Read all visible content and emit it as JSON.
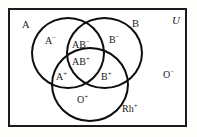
{
  "diagram": {
    "type": "venn",
    "universe_label": "U",
    "sets": [
      {
        "id": "A",
        "label": "A",
        "name": "circle-a"
      },
      {
        "id": "B",
        "label": "B",
        "name": "circle-b"
      },
      {
        "id": "Rh",
        "label": "Rh",
        "sign": "+",
        "name": "circle-rh"
      }
    ],
    "set_labels": {
      "a": "A",
      "b": "B",
      "rh_base": "Rh",
      "rh_sign": "+"
    },
    "regions": [
      {
        "id": "a-neg",
        "base": "A",
        "sign": "−",
        "in": [
          "A"
        ],
        "description": "A only"
      },
      {
        "id": "b-neg",
        "base": "B",
        "sign": "−",
        "in": [
          "B"
        ],
        "description": "B only"
      },
      {
        "id": "ab-neg",
        "base": "AB",
        "sign": "−",
        "in": [
          "A",
          "B"
        ],
        "description": "A and B, not Rh"
      },
      {
        "id": "ab-pos",
        "base": "AB",
        "sign": "+",
        "in": [
          "A",
          "B",
          "Rh"
        ],
        "description": "A and B and Rh"
      },
      {
        "id": "a-pos",
        "base": "A",
        "sign": "+",
        "in": [
          "A",
          "Rh"
        ],
        "description": "A and Rh"
      },
      {
        "id": "b-pos",
        "base": "B",
        "sign": "+",
        "in": [
          "B",
          "Rh"
        ],
        "description": "B and Rh"
      },
      {
        "id": "o-pos",
        "base": "O",
        "sign": "+",
        "in": [
          "Rh"
        ],
        "description": "Rh only"
      },
      {
        "id": "o-neg",
        "base": "O",
        "sign": "−",
        "in": [],
        "description": "outside all sets"
      }
    ],
    "region_text": {
      "a_neg_base": "A",
      "a_neg_sign": "−",
      "b_neg_base": "B",
      "b_neg_sign": "−",
      "ab_neg_base": "AB",
      "ab_neg_sign": "−",
      "ab_pos_base": "AB",
      "ab_pos_sign": "+",
      "a_pos_base": "A",
      "a_pos_sign": "+",
      "b_pos_base": "B",
      "b_pos_sign": "+",
      "o_pos_base": "O",
      "o_pos_sign": "+",
      "o_neg_base": "O",
      "o_neg_sign": "−",
      "rh_pos_base": "Rh",
      "rh_pos_sign": "+"
    },
    "colors": {
      "background": "#fdfdfb",
      "panel": "#ffffff",
      "stroke": "#0d0d0d",
      "border": "#1b1b1b",
      "text": "#1a1a1a"
    }
  }
}
